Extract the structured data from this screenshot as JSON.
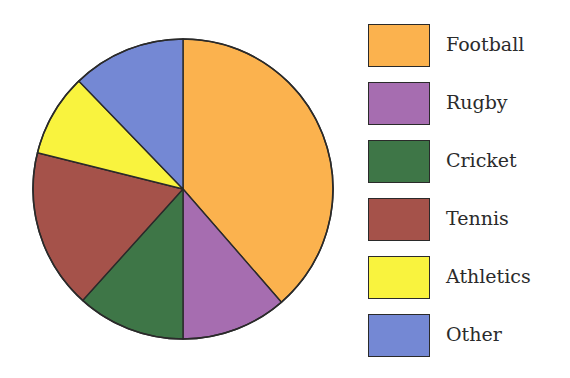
{
  "chart_data": {
    "type": "pie",
    "title": "",
    "start_angle_deg": 0,
    "direction": "clockwise",
    "units": "degrees",
    "categories": [
      "Football",
      "Rugby",
      "Cricket",
      "Tennis",
      "Athletics",
      "Other"
    ],
    "values": [
      139,
      41,
      42,
      62,
      32,
      44
    ],
    "percentages": [
      38.6,
      11.4,
      11.7,
      17.2,
      8.9,
      12.2
    ],
    "colors": [
      "#FBB24E",
      "#A66DB0",
      "#3E7647",
      "#A5524A",
      "#F9F33E",
      "#7488D4"
    ],
    "legend": {
      "position": "right",
      "entries": [
        {
          "label": "Football",
          "color": "#FBB24E"
        },
        {
          "label": "Rugby",
          "color": "#A66DB0"
        },
        {
          "label": "Cricket",
          "color": "#3E7647"
        },
        {
          "label": "Tennis",
          "color": "#A5524A"
        },
        {
          "label": "Athletics",
          "color": "#F9F33E"
        },
        {
          "label": "Other",
          "color": "#7488D4"
        }
      ]
    },
    "data_labels": false
  },
  "geometry": {
    "cx": 183,
    "cy": 189,
    "r": 150
  }
}
